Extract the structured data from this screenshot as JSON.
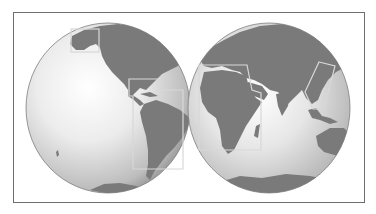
{
  "figure": {
    "type": "twin-hemisphere world map",
    "hemispheres": [
      {
        "name": "western-hemisphere",
        "center": [
          108,
          108
        ],
        "rx": 82,
        "ry": 85
      },
      {
        "name": "eastern-hemisphere",
        "center": [
          269,
          108
        ],
        "rx": 81,
        "ry": 85
      }
    ],
    "highlight_boxes": [
      {
        "region": "Alaska",
        "hemisphere": "western"
      },
      {
        "region": "Central America / Caribbean and South America",
        "hemisphere": "western"
      },
      {
        "region": "Africa",
        "hemisphere": "eastern"
      },
      {
        "region": "Southeast Asia",
        "hemisphere": "eastern"
      }
    ],
    "colors": {
      "frame": "#6e6e6e",
      "land": "#7a7a7a",
      "ocean_light": "#f4f4f4",
      "ocean_dark": "#9a9a9a",
      "highlight_box": "#d8d8d8"
    }
  }
}
